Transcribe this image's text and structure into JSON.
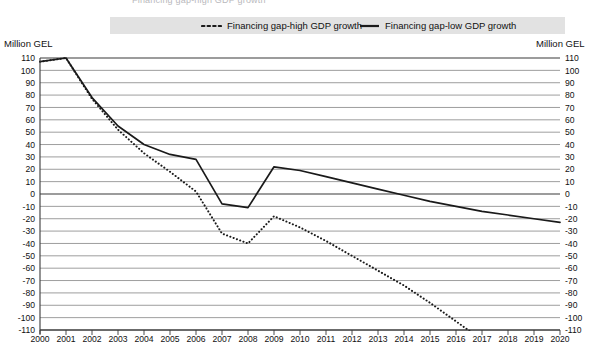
{
  "page": {
    "clipped_top_text": "Financing gap-high GDP growth"
  },
  "legend": {
    "position": "top",
    "background_color": "#e2e2e2",
    "items": [
      {
        "label": "Financing gap-high GDP growth",
        "style": "dotted",
        "color": "#1a1a1a"
      },
      {
        "label": "Financing gap-low GDP growth",
        "style": "solid",
        "color": "#1a1a1a"
      }
    ]
  },
  "axes": {
    "left_caption": "Million GEL",
    "right_caption": "Million GEL",
    "y_ticks": [
      "110",
      "100",
      "90",
      "80",
      "70",
      "60",
      "50",
      "40",
      "30",
      "20",
      "10",
      "0",
      "-10",
      "-20",
      "-30",
      "-40",
      "-50",
      "-60",
      "-70",
      "-80",
      "-90",
      "-100",
      "-110"
    ],
    "x_ticks": [
      "2000",
      "2001",
      "2002",
      "2003",
      "2004",
      "2005",
      "2006",
      "2007",
      "2008",
      "2009",
      "2010",
      "2011",
      "2012",
      "2013",
      "2014",
      "2015",
      "2016",
      "2017",
      "2018",
      "2019",
      "2020"
    ]
  },
  "chart_data": {
    "type": "line",
    "title": "",
    "subtitle": "",
    "xlabel": "",
    "ylabel": "Million GEL",
    "y2label": "Million GEL",
    "grid": true,
    "legend_position": "top",
    "xlim": [
      2000,
      2020
    ],
    "ylim": [
      -110,
      110
    ],
    "ytick_step": 10,
    "x": [
      2000,
      2001,
      2002,
      2003,
      2004,
      2005,
      2006,
      2007,
      2008,
      2009,
      2010,
      2011,
      2012,
      2013,
      2014,
      2015,
      2016,
      2017,
      2018,
      2019,
      2020
    ],
    "series": [
      {
        "name": "Financing gap-low GDP growth",
        "style": "solid",
        "color": "#1a1a1a",
        "values": [
          107,
          110,
          78,
          55,
          40,
          32,
          28,
          -8,
          -11,
          22,
          19,
          14,
          9,
          4,
          -1,
          -6,
          -10,
          -14,
          -17,
          -20,
          -23
        ]
      },
      {
        "name": "Financing gap-high GDP growth",
        "style": "dotted",
        "color": "#1a1a1a",
        "values": [
          107,
          110,
          77,
          52,
          33,
          18,
          2,
          -32,
          -40,
          -18,
          -27,
          -38,
          -50,
          -62,
          -74,
          -88,
          -103,
          null,
          null,
          null,
          null
        ],
        "note": "series runs off the bottom of the plot between 2016 and 2017"
      }
    ]
  }
}
